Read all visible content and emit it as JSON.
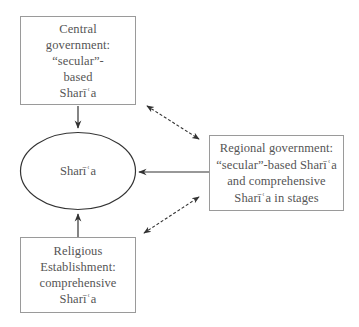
{
  "diagram": {
    "nodes": {
      "central": {
        "label": "Central\ngovernment:\n“secular”-\nbased\nSharīʿa"
      },
      "sharia": {
        "label": "Sharīʿa"
      },
      "regional": {
        "label": "Regional government:\n“secular”-based Sharīʿa\nand comprehensive\nSharīʿa in stages"
      },
      "religious": {
        "label": "Religious\nEstablishment:\ncomprehensive\nSharīʿa"
      }
    },
    "edges": [
      {
        "from": "central",
        "to": "sharia",
        "style": "solid",
        "direction": "one-way"
      },
      {
        "from": "religious",
        "to": "sharia",
        "style": "solid",
        "direction": "one-way"
      },
      {
        "from": "regional",
        "to": "sharia",
        "style": "solid",
        "direction": "one-way"
      },
      {
        "from": "central",
        "to": "regional",
        "style": "dashed",
        "direction": "two-way"
      },
      {
        "from": "religious",
        "to": "regional",
        "style": "dashed",
        "direction": "two-way"
      }
    ],
    "colors": {
      "stroke": "#333333",
      "box_border": "#9a9a9a",
      "text": "#555555"
    }
  }
}
